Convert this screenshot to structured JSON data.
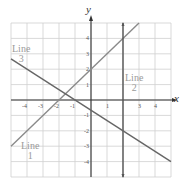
{
  "chart_data": {
    "type": "line",
    "title": "",
    "xlabel": "x",
    "ylabel": "y",
    "xlim": [
      -5,
      5
    ],
    "ylim": [
      -5,
      5
    ],
    "grid": true,
    "x_ticks": [
      "-4",
      "-3",
      "-2",
      "-1",
      "1",
      "3",
      "4"
    ],
    "y_ticks": [
      "4",
      "3",
      "2",
      "1",
      "-1",
      "-2",
      "-3",
      "-4"
    ],
    "series": [
      {
        "name": "Line 1",
        "equation": "y = x + 2",
        "points": [
          [
            -5,
            -3
          ],
          [
            3,
            5
          ]
        ],
        "label_lines": [
          "Line",
          "1"
        ]
      },
      {
        "name": "Line 2",
        "equation": "x = 2",
        "points": [
          [
            2,
            -5
          ],
          [
            2,
            5
          ]
        ],
        "label_lines": [
          "Line",
          "2"
        ]
      },
      {
        "name": "Line 3",
        "equation": "y = -2/3 x - 2/3",
        "points": [
          [
            -5,
            2.667
          ],
          [
            5,
            -4
          ]
        ],
        "label_lines": [
          "Line",
          "3"
        ]
      }
    ],
    "colors": {
      "line1": "#8a8a8a",
      "line2": "#555555",
      "line3": "#666666",
      "grid": "#cfcfcf",
      "axis": "#333333",
      "label": "#9a9a9a"
    }
  }
}
